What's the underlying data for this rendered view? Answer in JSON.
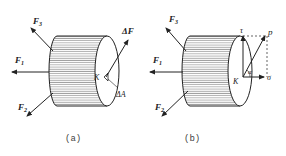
{
  "figures": [
    {
      "id": "a",
      "caption": "(a)",
      "forces": [
        {
          "label": "F",
          "sub": "3"
        },
        {
          "label": "F",
          "sub": "1"
        },
        {
          "label": "F",
          "sub": "2"
        }
      ],
      "point_label": "K",
      "force_increment_label": "ΔF",
      "area_label": "ΔA"
    },
    {
      "id": "b",
      "caption": "(b)",
      "forces": [
        {
          "label": "F",
          "sub": "3"
        },
        {
          "label": "F",
          "sub": "1"
        },
        {
          "label": "F",
          "sub": "2"
        }
      ],
      "point_label": "K",
      "stress_total_label": "p",
      "shear_stress_label": "τ",
      "normal_stress_label": "σ",
      "angle_label": "α"
    }
  ],
  "colors": {
    "line": "#222222",
    "hatch": "#555555",
    "background": "#ffffff"
  }
}
